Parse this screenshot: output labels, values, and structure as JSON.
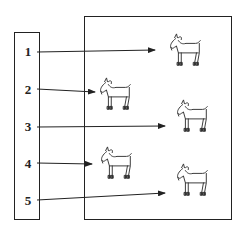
{
  "diagram": {
    "left_panel": {
      "labels": [
        "1",
        "2",
        "3",
        "4",
        "5"
      ]
    },
    "right_panel": {
      "goats": [
        {
          "id": "goat-1",
          "icon": "goat-icon"
        },
        {
          "id": "goat-2",
          "icon": "goat-icon"
        },
        {
          "id": "goat-3",
          "icon": "goat-icon"
        },
        {
          "id": "goat-4",
          "icon": "goat-icon"
        },
        {
          "id": "goat-5",
          "icon": "goat-icon"
        }
      ]
    },
    "arrows": [
      {
        "from": "1",
        "to": "near-goat-1"
      },
      {
        "from": "2",
        "to": "goat-2"
      },
      {
        "from": "3",
        "to": "near-goat-3"
      },
      {
        "from": "4",
        "to": "goat-4"
      },
      {
        "from": "5",
        "to": "near-goat-5"
      }
    ],
    "colors": {
      "line": "#222222",
      "background": "#ffffff"
    }
  }
}
